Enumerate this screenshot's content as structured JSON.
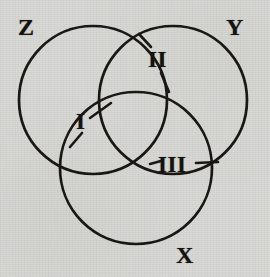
{
  "figure": {
    "kind": "venn-diagram",
    "set_count": 3,
    "background_color": "#d7d7d4",
    "ink_color": "#15120f",
    "set_labels": [
      {
        "id": "Z",
        "text": "Z",
        "position": "top-left"
      },
      {
        "id": "Y",
        "text": "Y",
        "position": "top-right"
      },
      {
        "id": "X",
        "text": "X",
        "position": "bottom-center"
      }
    ],
    "region_labels": [
      {
        "id": "I",
        "text": "I",
        "meaning": "Z and X only",
        "position": "left-center"
      },
      {
        "id": "II",
        "text": "II",
        "meaning": "Z and Y only",
        "position": "top-center"
      },
      {
        "id": "III",
        "text": "III",
        "meaning": "X and Y only",
        "position": "right-center"
      }
    ],
    "circles": [
      {
        "id": "Z",
        "cx": 93,
        "cy": 100,
        "r": 74
      },
      {
        "id": "Y",
        "cx": 173,
        "cy": 100,
        "r": 74
      },
      {
        "id": "X",
        "cx": 136,
        "cy": 168,
        "r": 76
      }
    ]
  }
}
